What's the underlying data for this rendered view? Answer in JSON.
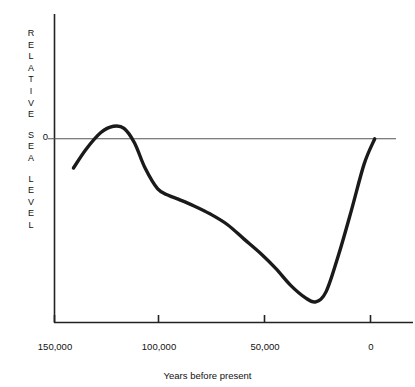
{
  "chart_data": {
    "type": "line",
    "title": "",
    "xlabel": "Years before present",
    "ylabel": "RELATIVE SEA LEVEL",
    "ylabel_words": [
      "RELATIVE",
      "SEA",
      "LEVEL"
    ],
    "xlim": [
      150000,
      -7500
    ],
    "xticks": [
      150000,
      100000,
      50000,
      0
    ],
    "xtick_labels": [
      "150,000",
      "100,000",
      "50,000",
      "0"
    ],
    "yticks": [
      0
    ],
    "ytick_labels": [
      "0"
    ],
    "grid": false,
    "legend": null,
    "axis_color": "#222222",
    "line_color": "#1a1a1a",
    "zero_line_label": "0",
    "series": [
      {
        "name": "Relative sea level",
        "x": [
          141000,
          135000,
          128000,
          122000,
          117000,
          112000,
          107000,
          101000,
          96000,
          91000,
          84000,
          76000,
          68000,
          60000,
          52000,
          45000,
          38000,
          31000,
          26000,
          21000,
          15000,
          9000,
          3000,
          -2000
        ],
        "y": [
          -14,
          -5,
          3,
          6,
          5,
          -2,
          -14,
          -24,
          -27,
          -29,
          -32,
          -36,
          -41,
          -48,
          -55,
          -62,
          -70,
          -76,
          -78,
          -73,
          -55,
          -34,
          -12,
          0
        ]
      }
    ]
  },
  "xaxis": {
    "title": "Years before present",
    "tick_labels": [
      "150,000",
      "100,000",
      "50,000",
      "0"
    ]
  },
  "yaxis": {
    "label_words": [
      "RELATIVE",
      "SEA",
      "LEVEL"
    ],
    "zero_label": "0"
  }
}
